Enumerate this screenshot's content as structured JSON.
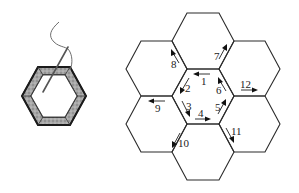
{
  "figure": {
    "left_panel": {
      "description": "Paper-pieced hexagon with fabric folded over template, needle and thread whip-stitching",
      "colors": {
        "fabric": "#9a9a9a",
        "border": "#2a2a2a",
        "thread": "#6e6e6e"
      }
    },
    "right_panel": {
      "description": "Rosette of seven hexagons with numbered stitching order",
      "steps": [
        {
          "n": "1",
          "label": "1"
        },
        {
          "n": "2",
          "label": "2"
        },
        {
          "n": "3",
          "label": "3"
        },
        {
          "n": "4",
          "label": "4"
        },
        {
          "n": "5",
          "label": "5"
        },
        {
          "n": "6",
          "label": "6"
        },
        {
          "n": "7",
          "label": "7"
        },
        {
          "n": "8",
          "label": "8"
        },
        {
          "n": "9",
          "label": "9"
        },
        {
          "n": "10",
          "label": "10"
        },
        {
          "n": "11",
          "label": "11"
        },
        {
          "n": "12",
          "label": "12"
        }
      ]
    }
  }
}
